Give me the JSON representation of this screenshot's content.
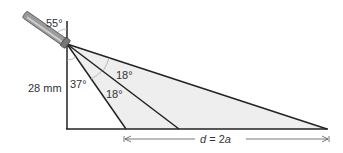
{
  "diagram": {
    "labels": {
      "tilt_angle": "55°",
      "height": "28 mm",
      "left_angle": "37°",
      "upper_spread": "18°",
      "lower_spread": "18°",
      "distance_var": "d",
      "distance_eq": " = 2",
      "distance_a": "a"
    },
    "colors": {
      "fill": "#eeeeee",
      "line": "#222222",
      "light_line": "#999999",
      "text": "#333333"
    },
    "objects": [
      "flashlight",
      "vertical-post",
      "ground-line",
      "light-beam-rays",
      "dimension-arrow"
    ]
  }
}
